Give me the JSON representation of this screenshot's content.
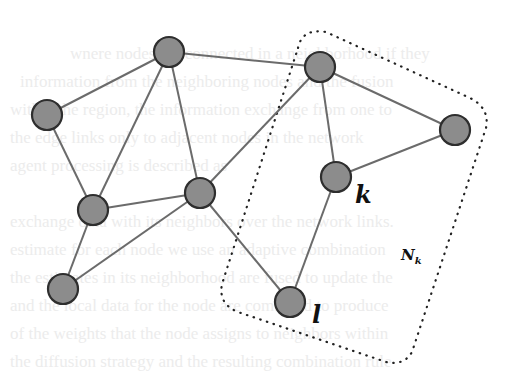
{
  "diagram": {
    "type": "network-graph",
    "node_style": {
      "fill": "#8c8c8c",
      "stroke": "#2e2e2e",
      "radius": 15
    },
    "edge_style": {
      "stroke": "#6b6b6b",
      "width": 2
    },
    "region_style": {
      "stroke": "#222222",
      "dash": "dotted"
    },
    "nodes": [
      {
        "id": "A",
        "x": 47,
        "y": 115,
        "label": ""
      },
      {
        "id": "B",
        "x": 169,
        "y": 52,
        "label": ""
      },
      {
        "id": "C",
        "x": 320,
        "y": 67,
        "label": ""
      },
      {
        "id": "D",
        "x": 455,
        "y": 130,
        "label": ""
      },
      {
        "id": "E",
        "x": 336,
        "y": 177,
        "label": "k"
      },
      {
        "id": "F",
        "x": 200,
        "y": 193,
        "label": ""
      },
      {
        "id": "G",
        "x": 93,
        "y": 210,
        "label": ""
      },
      {
        "id": "H",
        "x": 63,
        "y": 289,
        "label": ""
      },
      {
        "id": "I",
        "x": 290,
        "y": 302,
        "label": "l"
      }
    ],
    "edges": [
      [
        "A",
        "B"
      ],
      [
        "A",
        "G"
      ],
      [
        "B",
        "G"
      ],
      [
        "B",
        "F"
      ],
      [
        "B",
        "C"
      ],
      [
        "C",
        "F"
      ],
      [
        "C",
        "E"
      ],
      [
        "C",
        "D"
      ],
      [
        "D",
        "E"
      ],
      [
        "E",
        "I"
      ],
      [
        "F",
        "G"
      ],
      [
        "F",
        "H"
      ],
      [
        "F",
        "I"
      ],
      [
        "G",
        "H"
      ]
    ],
    "labels": {
      "node_k": "k",
      "node_l": "l",
      "neighborhood_main": "N",
      "neighborhood_sub": "k"
    },
    "neighborhood": {
      "name": "N_k",
      "contains": [
        "C",
        "D",
        "E",
        "I"
      ]
    }
  }
}
